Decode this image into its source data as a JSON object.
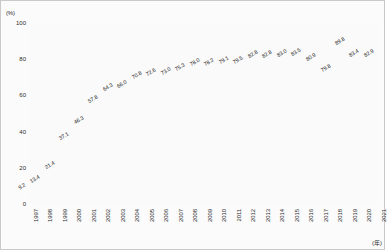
{
  "chart_data": {
    "type": "line",
    "title": "",
    "xlabel": "(年)",
    "ylabel": "(%)",
    "ylim": [
      0,
      100
    ],
    "yticks": [
      0,
      20,
      40,
      60,
      80,
      100
    ],
    "grid": true,
    "legend": "none",
    "marker": "circle",
    "categories": [
      "1997",
      "1998",
      "1999",
      "2000",
      "2001",
      "2002",
      "2003",
      "2004",
      "2005",
      "2006",
      "2007",
      "2008",
      "2009",
      "2010",
      "2011",
      "2012",
      "2013",
      "2014",
      "2015",
      "2016",
      "2017",
      "2018",
      "2019",
      "2020",
      "2021"
    ],
    "values": [
      9.2,
      13.4,
      21.4,
      37.1,
      46.3,
      57.8,
      64.3,
      66.0,
      70.8,
      72.6,
      73.0,
      75.3,
      78.0,
      78.2,
      79.1,
      79.5,
      82.8,
      82.8,
      83.0,
      83.5,
      80.9,
      79.8,
      89.8,
      83.4,
      82.9
    ],
    "point_labels": [
      "9.2",
      "13.4",
      "21.4",
      "37.1",
      "46.3",
      "57.8",
      "64.3",
      "66.0",
      "70.8",
      "72.6",
      "73.0",
      "75.3",
      "78.0",
      "78.2",
      "79.1",
      "79.5",
      "82.8",
      "82.8",
      "83.0",
      "83.5",
      "80.9",
      "79.8",
      "89.8",
      "83.4",
      "82.9"
    ],
    "colors": {
      "line": "#6b6b6b",
      "marker": "#4a4a4a",
      "grid": "#d5d5d5",
      "axis": "#8a8a8a",
      "background": "#fafafa",
      "text": "#1f1f1f"
    }
  }
}
